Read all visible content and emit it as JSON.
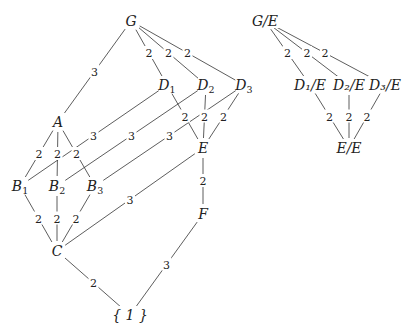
{
  "diagram": {
    "nodes": [
      {
        "id": "G",
        "label": "G",
        "sub": "",
        "x": 131,
        "y": 21
      },
      {
        "id": "D1",
        "label": "D",
        "sub": "1",
        "x": 167,
        "y": 85
      },
      {
        "id": "D2",
        "label": "D",
        "sub": "2",
        "x": 206,
        "y": 85
      },
      {
        "id": "D3",
        "label": "D",
        "sub": "3",
        "x": 244,
        "y": 85
      },
      {
        "id": "A",
        "label": "A",
        "sub": "",
        "x": 58,
        "y": 122
      },
      {
        "id": "E",
        "label": "E",
        "sub": "",
        "x": 203,
        "y": 148
      },
      {
        "id": "B1",
        "label": "B",
        "sub": "1",
        "x": 20,
        "y": 186
      },
      {
        "id": "B2",
        "label": "B",
        "sub": "2",
        "x": 57,
        "y": 186
      },
      {
        "id": "B3",
        "label": "B",
        "sub": "3",
        "x": 95,
        "y": 186
      },
      {
        "id": "F",
        "label": "F",
        "sub": "",
        "x": 203,
        "y": 214
      },
      {
        "id": "C",
        "label": "C",
        "sub": "",
        "x": 57,
        "y": 251
      },
      {
        "id": "one",
        "label": "{ 1 }",
        "sub": "",
        "x": 130,
        "y": 315
      },
      {
        "id": "GE",
        "label": "G/E",
        "sub": "",
        "x": 265,
        "y": 21
      },
      {
        "id": "D1E",
        "label": "D₁/E",
        "sub": "",
        "x": 310,
        "y": 85
      },
      {
        "id": "D2E",
        "label": "D₂/E",
        "sub": "",
        "x": 349,
        "y": 85
      },
      {
        "id": "D3E",
        "label": "D₃/E",
        "sub": "",
        "x": 385,
        "y": 85
      },
      {
        "id": "EE",
        "label": "E/E",
        "sub": "",
        "x": 349,
        "y": 148
      }
    ],
    "edges": [
      {
        "from": "G",
        "to": "A",
        "label": "3"
      },
      {
        "from": "G",
        "to": "D1",
        "label": "2"
      },
      {
        "from": "G",
        "to": "D2",
        "label": "2"
      },
      {
        "from": "G",
        "to": "D3",
        "label": "2"
      },
      {
        "from": "A",
        "to": "B1",
        "label": "2"
      },
      {
        "from": "A",
        "to": "B2",
        "label": "2"
      },
      {
        "from": "A",
        "to": "B3",
        "label": "2"
      },
      {
        "from": "D1",
        "to": "B1",
        "label": "3"
      },
      {
        "from": "D2",
        "to": "B2",
        "label": "3"
      },
      {
        "from": "D3",
        "to": "B3",
        "label": "3"
      },
      {
        "from": "D1",
        "to": "E",
        "label": "2"
      },
      {
        "from": "D2",
        "to": "E",
        "label": "2"
      },
      {
        "from": "D3",
        "to": "E",
        "label": "2"
      },
      {
        "from": "E",
        "to": "C",
        "label": "3"
      },
      {
        "from": "E",
        "to": "F",
        "label": "2"
      },
      {
        "from": "B1",
        "to": "C",
        "label": "2"
      },
      {
        "from": "B2",
        "to": "C",
        "label": "2"
      },
      {
        "from": "B3",
        "to": "C",
        "label": "2"
      },
      {
        "from": "C",
        "to": "one",
        "label": "2"
      },
      {
        "from": "F",
        "to": "one",
        "label": "3"
      },
      {
        "from": "GE",
        "to": "D1E",
        "label": "2"
      },
      {
        "from": "GE",
        "to": "D2E",
        "label": "2"
      },
      {
        "from": "GE",
        "to": "D3E",
        "label": "2"
      },
      {
        "from": "D1E",
        "to": "EE",
        "label": "2"
      },
      {
        "from": "D2E",
        "to": "EE",
        "label": "2"
      },
      {
        "from": "D3E",
        "to": "EE",
        "label": "2"
      }
    ]
  }
}
